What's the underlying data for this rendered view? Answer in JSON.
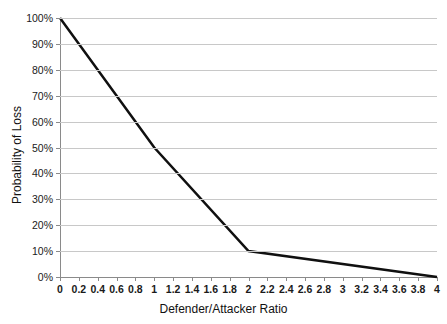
{
  "chart_data": {
    "type": "line",
    "title": "",
    "xlabel": "Defender/Attacker Ratio",
    "ylabel": "Probability of Loss",
    "xlim": [
      0,
      4
    ],
    "ylim": [
      0,
      1
    ],
    "grid": "horizontal",
    "legend": "none",
    "x_ticks": [
      "0",
      "0.2",
      "0.4",
      "0.6",
      "0.8",
      "1",
      "1.2",
      "1.4",
      "1.6",
      "1.8",
      "2",
      "2.2",
      "2.4",
      "2.6",
      "2.8",
      "3",
      "3.2",
      "3.4",
      "3.6",
      "3.8",
      "4"
    ],
    "x_tick_values": [
      0,
      0.2,
      0.4,
      0.6,
      0.8,
      1,
      1.2,
      1.4,
      1.6,
      1.8,
      2,
      2.2,
      2.4,
      2.6,
      2.8,
      3,
      3.2,
      3.4,
      3.6,
      3.8,
      4
    ],
    "y_ticks": [
      "0%",
      "10%",
      "20%",
      "30%",
      "40%",
      "50%",
      "60%",
      "70%",
      "80%",
      "90%",
      "100%"
    ],
    "y_tick_values": [
      0,
      0.1,
      0.2,
      0.3,
      0.4,
      0.5,
      0.6,
      0.7,
      0.8,
      0.9,
      1.0
    ],
    "series": [
      {
        "name": "Probability of Loss",
        "color": "#101010",
        "line_width": 2.5,
        "x": [
          0,
          1,
          2,
          4
        ],
        "values": [
          1.0,
          0.5,
          0.1,
          0.0
        ]
      }
    ],
    "vertices": [
      {
        "x": 0,
        "y": 1.0,
        "label": "0, 100%"
      },
      {
        "x": 1,
        "y": 0.5,
        "label": "1, 50%"
      },
      {
        "x": 2,
        "y": 0.1,
        "label": "2, 10%"
      },
      {
        "x": 4,
        "y": 0.0,
        "label": "4, 0%"
      }
    ]
  },
  "colors": {
    "line": "#101010",
    "gridline": "#c8c8c8",
    "axis": "#8a8a8a",
    "text": "#1a1a1a",
    "background": "#ffffff"
  },
  "cut_title_fragment": "·                           ·"
}
